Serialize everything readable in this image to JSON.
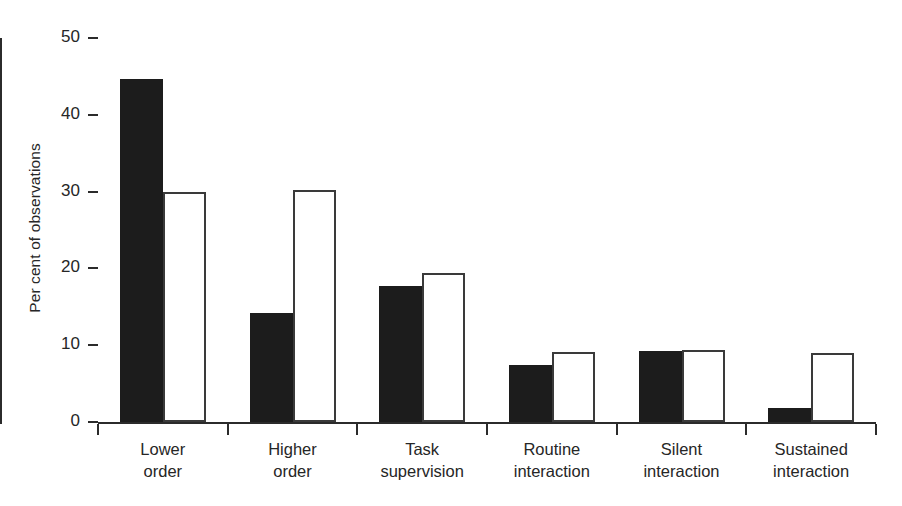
{
  "chart_data": {
    "type": "bar",
    "title": "",
    "subtitle": "",
    "xlabel": "",
    "ylabel": "Per cent of observations",
    "ylim": [
      0,
      50
    ],
    "yticks": [
      0,
      10,
      20,
      30,
      40,
      50
    ],
    "ytick_labels": [
      "0",
      "10",
      "20",
      "30",
      "40",
      "50"
    ],
    "grid": false,
    "legend": "none",
    "categories": [
      "Lower order",
      "Higher order",
      "Task supervision",
      "Routine interaction",
      "Silent interaction",
      "Sustained interaction"
    ],
    "category_lines": [
      [
        "Lower",
        "order"
      ],
      [
        "Higher",
        "order"
      ],
      [
        "Task",
        "supervision"
      ],
      [
        "Routine",
        "interaction"
      ],
      [
        "Silent",
        "interaction"
      ],
      [
        "Sustained",
        "interaction"
      ]
    ],
    "series": [
      {
        "name": "filled",
        "style": "solid-black",
        "color": "#1c1c1c",
        "values": [
          44.7,
          14.2,
          17.7,
          7.4,
          9.3,
          1.8
        ]
      },
      {
        "name": "open",
        "style": "white-outline",
        "color": "#ffffff",
        "edge_color": "#3a3a3a",
        "values": [
          29.9,
          30.2,
          19.4,
          9.1,
          9.4,
          9.0
        ]
      }
    ]
  },
  "axis": {
    "y_label": "Per cent of observations",
    "y_ticks": [
      "0",
      "10",
      "20",
      "30",
      "40",
      "50"
    ]
  }
}
